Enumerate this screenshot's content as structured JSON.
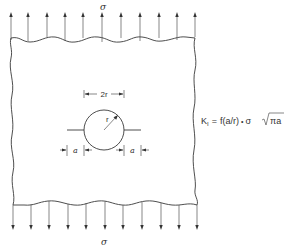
{
  "figure": {
    "type": "plate-with-circular-hole-and-cracks",
    "top_load_label": "σ",
    "bottom_load_label": "σ",
    "top_arrow_count": 11,
    "bottom_arrow_count": 11,
    "hole": {
      "radius_label": "r",
      "diameter_label": "2r"
    },
    "cracks": {
      "left_length_label": "a",
      "right_length_label": "a"
    },
    "formula": {
      "lhs": "K",
      "lhs_subscript": "I",
      "equals": "=",
      "function_part": "f(a/r)",
      "dot": "•",
      "sigma": "σ",
      "sqrt_content": "πa",
      "full_text": "K_I = f(a/r) • σ √(πa)"
    },
    "colors": {
      "line": "#3a3a3a",
      "background": "#ffffff"
    }
  }
}
